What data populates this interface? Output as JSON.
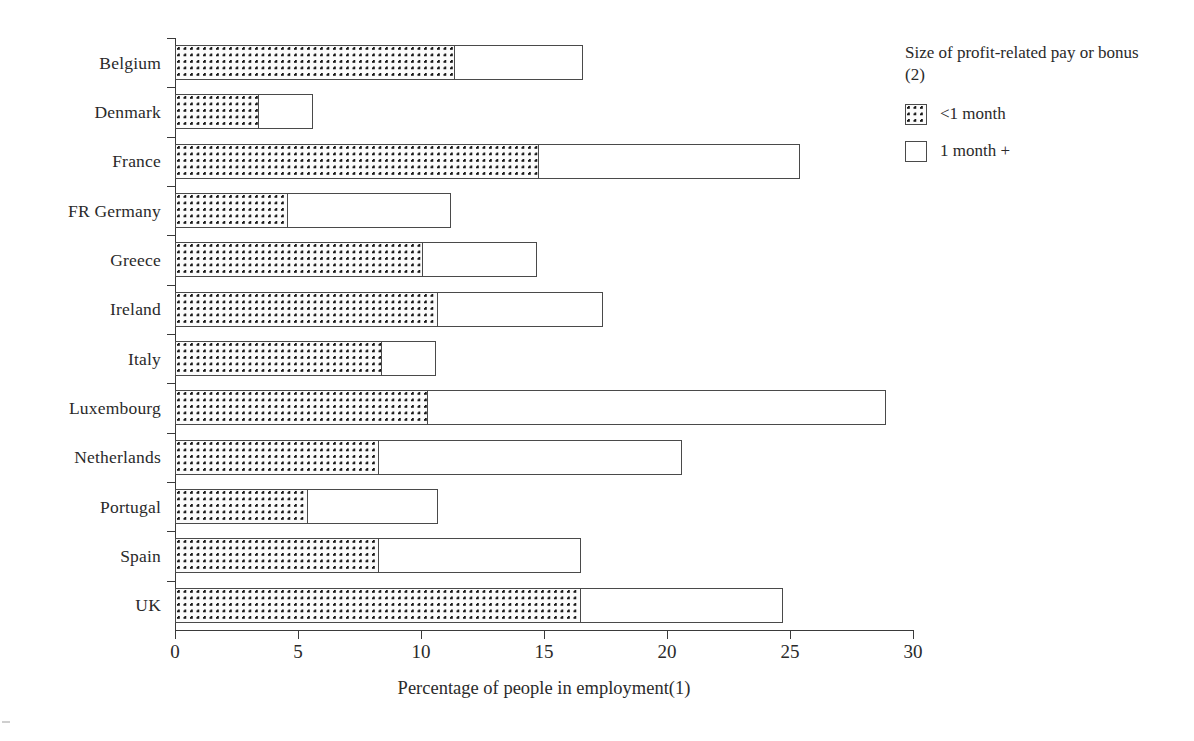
{
  "chart_data": {
    "type": "bar",
    "orientation": "horizontal",
    "stacked": true,
    "title": "",
    "xlabel": "Percentage of  people in employment(1)",
    "ylabel": "",
    "xlim": [
      0,
      30
    ],
    "xticks": [
      0,
      5,
      10,
      15,
      20,
      25,
      30
    ],
    "xtick_labels": [
      "0",
      "5",
      "10",
      "15",
      "20",
      "25",
      "30"
    ],
    "grid": false,
    "categories": [
      "Belgium",
      "Denmark",
      "France",
      "FR Germany",
      "Greece",
      "Ireland",
      "Italy",
      "Luxembourg",
      "Netherlands",
      "Portugal",
      "Spain",
      "UK"
    ],
    "series": [
      {
        "name": "<1 month",
        "fill": "dotted",
        "values": [
          11.4,
          3.4,
          14.8,
          4.6,
          10.1,
          10.7,
          8.4,
          10.3,
          8.3,
          5.4,
          8.3,
          16.5
        ]
      },
      {
        "name": "1 month +",
        "fill": "white",
        "values": [
          5.2,
          2.2,
          10.6,
          6.6,
          4.6,
          6.7,
          2.2,
          18.6,
          12.3,
          5.3,
          8.2,
          8.2
        ]
      }
    ],
    "totals": [
      16.6,
      5.6,
      25.4,
      11.2,
      14.7,
      17.4,
      10.6,
      28.9,
      20.6,
      10.7,
      16.5,
      24.7
    ],
    "legend": {
      "position": "right",
      "title": "Size of profit-related pay or bonus (2)",
      "entries": [
        {
          "label": "<1 month",
          "swatch": "dotted-swatch"
        },
        {
          "label": "1 month +",
          "swatch": "white-swatch"
        }
      ]
    }
  },
  "axis": {
    "x_title": "Percentage of  people in employment(1)"
  },
  "legend": {
    "title": "Size of profit-related pay or bonus (2)",
    "items": [
      {
        "label": "<1 month"
      },
      {
        "label": "1 month +"
      }
    ]
  }
}
